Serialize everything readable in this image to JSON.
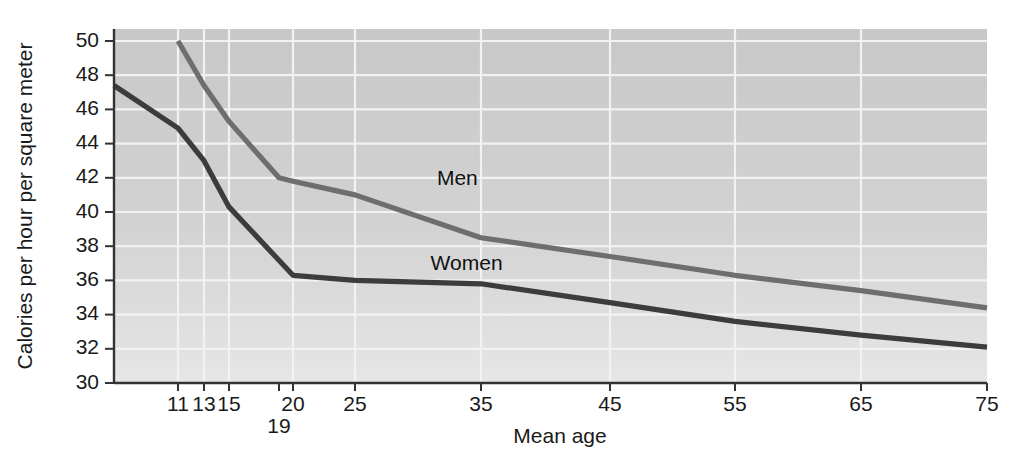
{
  "chart_data": {
    "type": "line",
    "title": "",
    "xlabel": "Mean age",
    "ylabel": "Calories per hour per square meter",
    "xlim": [
      9.5,
      75
    ],
    "ylim": [
      30,
      50
    ],
    "grid": true,
    "legend_position": "inline-labels",
    "x_ticks": [
      11,
      13,
      15,
      19,
      20,
      25,
      35,
      45,
      55,
      65,
      75
    ],
    "x_tick_labels": [
      "11",
      "13",
      "15",
      "19",
      "20",
      "25",
      "35",
      "45",
      "55",
      "65",
      "75"
    ],
    "y_ticks": [
      30,
      32,
      34,
      36,
      38,
      40,
      42,
      44,
      46,
      48,
      50
    ],
    "y_tick_labels": [
      "30",
      "32",
      "34",
      "36",
      "38",
      "40",
      "42",
      "44",
      "46",
      "48",
      "50"
    ],
    "series": [
      {
        "name": "Men",
        "color": "#6e6e6e",
        "label_text": "Men",
        "x": [
          11,
          13,
          15,
          19,
          20,
          25,
          35,
          45,
          55,
          65,
          75
        ],
        "values": [
          50.0,
          47.4,
          45.3,
          42.0,
          41.8,
          41.0,
          38.5,
          37.4,
          36.3,
          35.4,
          34.4
        ]
      },
      {
        "name": "Women",
        "color": "#3c3c3c",
        "label_text": "Women",
        "x": [
          9.5,
          11,
          13,
          15,
          20,
          25,
          35,
          45,
          55,
          65,
          75
        ],
        "values": [
          47.4,
          44.9,
          43.0,
          40.3,
          36.3,
          36.0,
          35.8,
          34.7,
          33.6,
          32.8,
          32.1
        ]
      }
    ],
    "annotations": [
      {
        "text": "Men",
        "x": 31.5,
        "y": 41.6
      },
      {
        "text": "Women",
        "x": 31.0,
        "y": 36.6
      }
    ]
  },
  "style": {
    "plot_background": "#c9c9c9",
    "plot_background_bottom": "#e3e3e3",
    "grid_color": "#f2f2f2",
    "axis_color": "#333333",
    "text_color": "#1a1a1a"
  }
}
